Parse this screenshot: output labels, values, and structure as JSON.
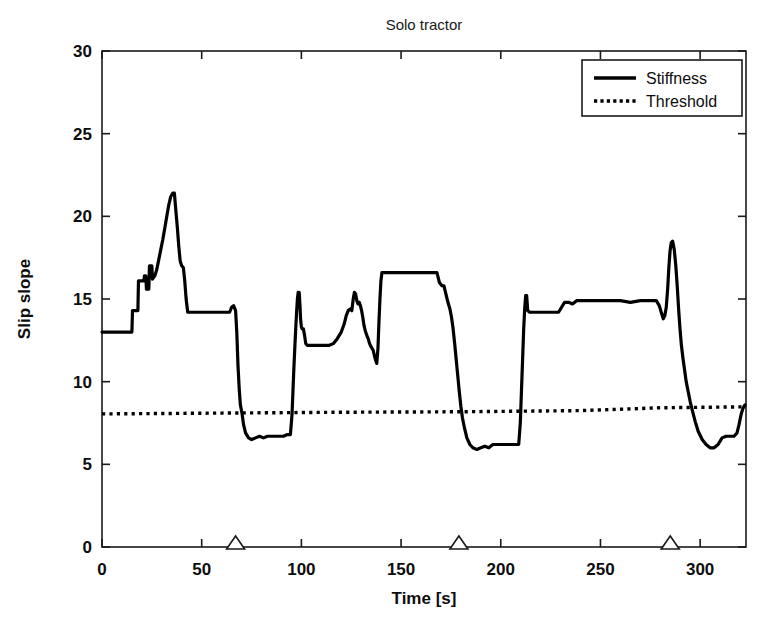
{
  "chart_data": {
    "type": "line",
    "title": "Solo tractor",
    "xlabel": "Time [s]",
    "ylabel": "Slip slope",
    "xlim": [
      0,
      323
    ],
    "ylim": [
      0,
      30
    ],
    "xticks": [
      0,
      50,
      100,
      150,
      200,
      250,
      300
    ],
    "yticks": [
      0,
      5,
      10,
      15,
      20,
      25,
      30
    ],
    "grid": false,
    "legend_position": "top-right",
    "legend": [
      {
        "name": "Stiffness",
        "style": "solid"
      },
      {
        "name": "Threshold",
        "style": "dotted"
      }
    ],
    "annotations": {
      "markers": {
        "symbol": "triangle-up",
        "axis": "x",
        "y": 0,
        "x": [
          67,
          179,
          285
        ]
      }
    },
    "series": [
      {
        "name": "Stiffness",
        "style": "solid",
        "color": "#000000",
        "points": [
          [
            0,
            13.0
          ],
          [
            15.0,
            13.0
          ],
          [
            15.3,
            14.3
          ],
          [
            18.0,
            14.3
          ],
          [
            18.3,
            16.1
          ],
          [
            21.0,
            16.1
          ],
          [
            21.3,
            16.4
          ],
          [
            22.0,
            16.4
          ],
          [
            22.3,
            15.6
          ],
          [
            23.5,
            15.6
          ],
          [
            23.8,
            17.0
          ],
          [
            25.0,
            17.0
          ],
          [
            25.3,
            16.2
          ],
          [
            26.5,
            16.4
          ],
          [
            27.5,
            16.8
          ],
          [
            28.5,
            17.4
          ],
          [
            29.5,
            18.0
          ],
          [
            30.5,
            18.6
          ],
          [
            31.5,
            19.3
          ],
          [
            32.5,
            20.0
          ],
          [
            33.5,
            20.7
          ],
          [
            34.5,
            21.2
          ],
          [
            35.5,
            21.4
          ],
          [
            36.3,
            21.4
          ],
          [
            37.0,
            20.4
          ],
          [
            37.8,
            19.3
          ],
          [
            38.5,
            18.2
          ],
          [
            39.2,
            17.3
          ],
          [
            40.0,
            17.0
          ],
          [
            40.8,
            16.9
          ],
          [
            41.5,
            16.1
          ],
          [
            42.2,
            15.0
          ],
          [
            43.0,
            14.2
          ],
          [
            44.0,
            14.2
          ],
          [
            45.0,
            14.2
          ],
          [
            50.0,
            14.2
          ],
          [
            60.0,
            14.2
          ],
          [
            64.0,
            14.2
          ],
          [
            65.0,
            14.5
          ],
          [
            66.0,
            14.6
          ],
          [
            67.0,
            14.3
          ],
          [
            67.6,
            13.0
          ],
          [
            68.2,
            11.0
          ],
          [
            68.8,
            9.6
          ],
          [
            69.4,
            8.6
          ],
          [
            70.2,
            8.1
          ],
          [
            71.0,
            7.4
          ],
          [
            72.0,
            6.9
          ],
          [
            73.5,
            6.6
          ],
          [
            75.0,
            6.5
          ],
          [
            77.0,
            6.6
          ],
          [
            79.0,
            6.7
          ],
          [
            81.0,
            6.6
          ],
          [
            83.0,
            6.7
          ],
          [
            85.0,
            6.7
          ],
          [
            88.0,
            6.7
          ],
          [
            91.0,
            6.7
          ],
          [
            93.0,
            6.8
          ],
          [
            94.5,
            6.8
          ],
          [
            95.3,
            8.0
          ],
          [
            95.8,
            9.5
          ],
          [
            96.3,
            11.0
          ],
          [
            96.8,
            12.3
          ],
          [
            97.2,
            13.3
          ],
          [
            97.6,
            14.2
          ],
          [
            98.0,
            15.0
          ],
          [
            98.4,
            15.4
          ],
          [
            98.9,
            15.4
          ],
          [
            99.3,
            14.6
          ],
          [
            99.6,
            13.8
          ],
          [
            100.0,
            13.3
          ],
          [
            100.4,
            13.2
          ],
          [
            101.0,
            13.2
          ],
          [
            101.6,
            12.8
          ],
          [
            102.2,
            12.3
          ],
          [
            103.0,
            12.2
          ],
          [
            106.0,
            12.2
          ],
          [
            110.0,
            12.2
          ],
          [
            114.0,
            12.2
          ],
          [
            116.0,
            12.3
          ],
          [
            118.0,
            12.6
          ],
          [
            120.0,
            13.0
          ],
          [
            121.5,
            13.5
          ],
          [
            122.5,
            14.0
          ],
          [
            123.5,
            14.3
          ],
          [
            124.5,
            14.4
          ],
          [
            125.3,
            14.3
          ],
          [
            126.0,
            15.0
          ],
          [
            126.6,
            15.4
          ],
          [
            127.2,
            15.3
          ],
          [
            127.8,
            14.9
          ],
          [
            128.4,
            14.7
          ],
          [
            129.0,
            14.8
          ],
          [
            129.6,
            14.6
          ],
          [
            130.2,
            14.3
          ],
          [
            130.8,
            13.9
          ],
          [
            131.4,
            13.4
          ],
          [
            132.0,
            13.1
          ],
          [
            132.8,
            12.8
          ],
          [
            133.5,
            12.6
          ],
          [
            134.2,
            12.3
          ],
          [
            135.0,
            12.1
          ],
          [
            136.0,
            11.9
          ],
          [
            137.0,
            11.4
          ],
          [
            137.8,
            11.1
          ],
          [
            138.4,
            12.0
          ],
          [
            138.9,
            13.6
          ],
          [
            139.4,
            15.0
          ],
          [
            139.9,
            16.1
          ],
          [
            140.4,
            16.6
          ],
          [
            141.0,
            16.6
          ],
          [
            145.0,
            16.6
          ],
          [
            150.0,
            16.6
          ],
          [
            155.0,
            16.6
          ],
          [
            160.0,
            16.6
          ],
          [
            165.0,
            16.6
          ],
          [
            168.0,
            16.6
          ],
          [
            169.2,
            16.0
          ],
          [
            170.5,
            15.8
          ],
          [
            171.5,
            15.8
          ],
          [
            172.5,
            15.3
          ],
          [
            173.5,
            14.8
          ],
          [
            174.5,
            14.4
          ],
          [
            175.3,
            13.9
          ],
          [
            176.0,
            13.3
          ],
          [
            176.8,
            12.4
          ],
          [
            177.6,
            11.4
          ],
          [
            178.4,
            10.4
          ],
          [
            179.2,
            9.4
          ],
          [
            180.0,
            8.5
          ],
          [
            180.8,
            7.8
          ],
          [
            181.8,
            7.2
          ],
          [
            183.0,
            6.6
          ],
          [
            184.5,
            6.2
          ],
          [
            186.0,
            6.0
          ],
          [
            188.0,
            5.9
          ],
          [
            190.0,
            6.0
          ],
          [
            192.0,
            6.1
          ],
          [
            194.0,
            6.0
          ],
          [
            196.0,
            6.2
          ],
          [
            198.0,
            6.2
          ],
          [
            201.0,
            6.2
          ],
          [
            204.0,
            6.2
          ],
          [
            207.0,
            6.2
          ],
          [
            209.0,
            6.2
          ],
          [
            209.8,
            7.5
          ],
          [
            210.4,
            9.5
          ],
          [
            211.0,
            11.5
          ],
          [
            211.5,
            13.2
          ],
          [
            212.0,
            14.4
          ],
          [
            212.5,
            15.2
          ],
          [
            213.0,
            15.2
          ],
          [
            213.5,
            14.3
          ],
          [
            214.5,
            14.2
          ],
          [
            218.0,
            14.2
          ],
          [
            222.0,
            14.2
          ],
          [
            226.0,
            14.2
          ],
          [
            229.0,
            14.2
          ],
          [
            230.5,
            14.5
          ],
          [
            232.0,
            14.8
          ],
          [
            234.0,
            14.8
          ],
          [
            236.0,
            14.7
          ],
          [
            238.0,
            14.9
          ],
          [
            241.0,
            14.9
          ],
          [
            245.0,
            14.9
          ],
          [
            250.0,
            14.9
          ],
          [
            255.0,
            14.9
          ],
          [
            260.0,
            14.9
          ],
          [
            265.0,
            14.8
          ],
          [
            270.0,
            14.9
          ],
          [
            275.0,
            14.9
          ],
          [
            278.0,
            14.9
          ],
          [
            279.5,
            14.6
          ],
          [
            280.5,
            14.2
          ],
          [
            281.5,
            13.8
          ],
          [
            282.3,
            14.0
          ],
          [
            283.0,
            14.5
          ],
          [
            283.7,
            15.6
          ],
          [
            284.3,
            16.9
          ],
          [
            284.9,
            17.9
          ],
          [
            285.5,
            18.4
          ],
          [
            286.2,
            18.5
          ],
          [
            287.0,
            18.0
          ],
          [
            287.8,
            17.0
          ],
          [
            288.5,
            15.8
          ],
          [
            289.2,
            14.4
          ],
          [
            289.9,
            13.2
          ],
          [
            290.6,
            12.2
          ],
          [
            291.4,
            11.4
          ],
          [
            292.2,
            10.7
          ],
          [
            293.0,
            10.0
          ],
          [
            294.0,
            9.4
          ],
          [
            295.0,
            8.8
          ],
          [
            296.2,
            8.2
          ],
          [
            297.5,
            7.6
          ],
          [
            299.0,
            7.0
          ],
          [
            301.0,
            6.5
          ],
          [
            303.0,
            6.2
          ],
          [
            305.0,
            6.0
          ],
          [
            307.0,
            6.0
          ],
          [
            309.0,
            6.2
          ],
          [
            311.0,
            6.6
          ],
          [
            313.0,
            6.7
          ],
          [
            315.0,
            6.7
          ],
          [
            317.0,
            6.7
          ],
          [
            318.5,
            6.9
          ],
          [
            319.5,
            7.4
          ],
          [
            320.5,
            8.0
          ],
          [
            321.5,
            8.4
          ],
          [
            322.5,
            8.6
          ]
        ]
      },
      {
        "name": "Threshold",
        "style": "dotted",
        "color": "#000000",
        "points": [
          [
            0,
            8.05
          ],
          [
            60,
            8.1
          ],
          [
            120,
            8.15
          ],
          [
            180,
            8.18
          ],
          [
            240,
            8.25
          ],
          [
            280,
            8.42
          ],
          [
            323,
            8.48
          ]
        ]
      }
    ]
  }
}
